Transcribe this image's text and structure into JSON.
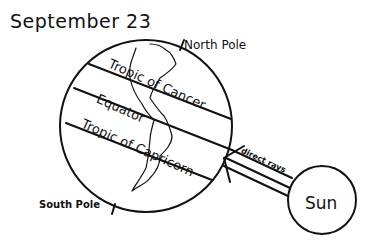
{
  "title": "September 23",
  "labels": {
    "north_pole": "North Pole",
    "south_pole": "South Pole",
    "tropic_of_cancer": "Tropic of Cancer",
    "equator": "Equator",
    "tropic_of_capricorn": "Tropic of Capricorn",
    "direct_rays": "direct rays",
    "sun": "Sun"
  },
  "colors": {
    "ink": "#111111",
    "background": "#ffffff"
  }
}
